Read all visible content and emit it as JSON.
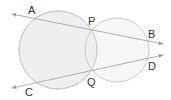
{
  "diagram": {
    "type": "two intersecting circles with two secant lines",
    "colors": {
      "circle_fill": "#efefef",
      "circle_stroke": "#c8c8c8",
      "line": "#9a9a9a",
      "label": "#333333"
    },
    "circles": [
      {
        "name": "left-circle",
        "cx": 58,
        "cy": 50,
        "r": 39
      },
      {
        "name": "right-circle",
        "cx": 117,
        "cy": 50,
        "r": 32
      }
    ],
    "points": {
      "A": {
        "label": "A",
        "x": 33,
        "y": 18,
        "lx": 28,
        "ly": 14
      },
      "B": {
        "label": "B",
        "x": 148,
        "y": 41,
        "lx": 148,
        "ly": 38
      },
      "C": {
        "label": "C",
        "x": 28,
        "y": 84,
        "lx": 25,
        "ly": 96
      },
      "D": {
        "label": "D",
        "x": 148,
        "y": 58,
        "lx": 148,
        "ly": 70
      },
      "P": {
        "label": "P",
        "x": 92,
        "y": 30,
        "lx": 88,
        "ly": 25
      },
      "Q": {
        "label": "Q",
        "x": 92,
        "y": 72,
        "lx": 87,
        "ly": 86
      }
    },
    "lines": [
      {
        "name": "line-AB",
        "through": [
          "A",
          "P",
          "B"
        ],
        "x1": 12,
        "y1": 14,
        "x2": 163,
        "y2": 44
      },
      {
        "name": "line-CD",
        "through": [
          "C",
          "Q",
          "D"
        ],
        "x1": 12,
        "y1": 88,
        "x2": 163,
        "y2": 55
      }
    ]
  }
}
